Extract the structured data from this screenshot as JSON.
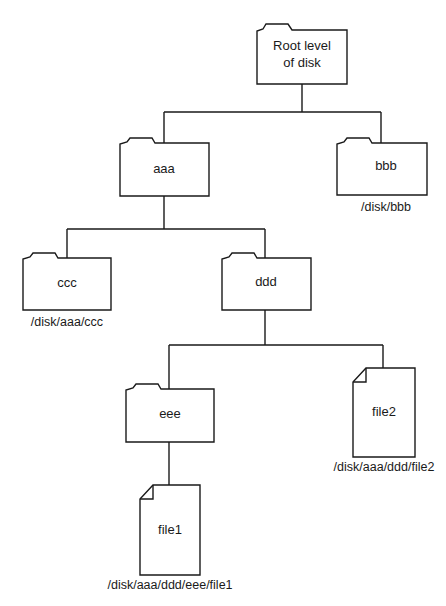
{
  "diagram": {
    "type": "directory-tree",
    "nodes": {
      "root": {
        "kind": "folder",
        "label_line1": "Root level",
        "label_line2": "of disk",
        "path": ""
      },
      "aaa": {
        "kind": "folder",
        "label": "aaa",
        "path": ""
      },
      "bbb": {
        "kind": "folder",
        "label": "bbb",
        "path": "/disk/bbb"
      },
      "ccc": {
        "kind": "folder",
        "label": "ccc",
        "path": "/disk/aaa/ccc"
      },
      "ddd": {
        "kind": "folder",
        "label": "ddd",
        "path": ""
      },
      "eee": {
        "kind": "folder",
        "label": "eee",
        "path": ""
      },
      "file1": {
        "kind": "file",
        "label": "file1",
        "path": "/disk/aaa/ddd/eee/file1"
      },
      "file2": {
        "kind": "file",
        "label": "file2",
        "path": "/disk/aaa/ddd/file2"
      }
    },
    "edges": [
      [
        "root",
        "aaa"
      ],
      [
        "root",
        "bbb"
      ],
      [
        "aaa",
        "ccc"
      ],
      [
        "aaa",
        "ddd"
      ],
      [
        "ddd",
        "eee"
      ],
      [
        "ddd",
        "file2"
      ],
      [
        "eee",
        "file1"
      ]
    ]
  }
}
